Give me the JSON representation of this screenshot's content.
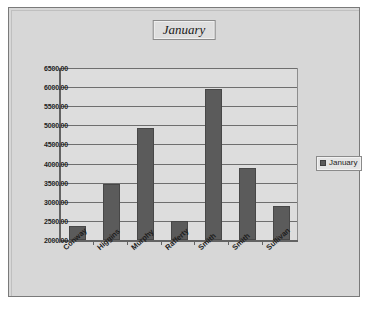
{
  "chart_data": {
    "type": "bar",
    "title": "January",
    "xlabel": "",
    "ylabel": "",
    "categories": [
      "Conway",
      "Higgins",
      "Murphy",
      "Rafferty",
      "Smith",
      "Smith",
      "Sullivan"
    ],
    "values": [
      2370,
      3460,
      4930,
      2500,
      5950,
      3880,
      2890
    ],
    "series": [
      {
        "name": "January",
        "values": [
          2370,
          3460,
          4930,
          2500,
          5950,
          3880,
          2890
        ]
      }
    ],
    "ylim": [
      2000,
      6500
    ],
    "ytick_step": 500,
    "ytick_labels": [
      "6500.00",
      "6000.00",
      "5500.00",
      "5000.00",
      "4500.00",
      "4000.00",
      "3500.00",
      "3000.00",
      "2500.00",
      "2000.00"
    ],
    "grid": true,
    "legend": {
      "position": "right",
      "entries": [
        "January"
      ]
    },
    "colors": {
      "bar": "#5b5b5b",
      "bar_border": "#474747",
      "plot_background": "#dddddd",
      "chart_background": "#d7d7d7",
      "gridline": "#6e6e6e",
      "axis": "#636363",
      "text": "#1d1d1d"
    }
  }
}
